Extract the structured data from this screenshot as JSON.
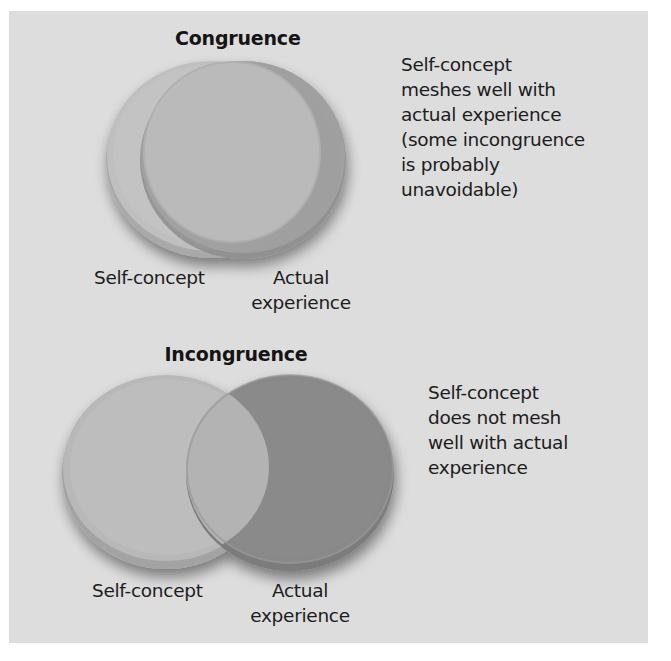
{
  "diagram": {
    "colors": {
      "background": "#dddddd",
      "self_concept_fill": "#bdbdbd",
      "actual_experience_fill": "#8a8a8a",
      "overlap_fill": "#b4b4b4",
      "text": "#1c1c1c"
    },
    "congruence": {
      "title": "Congruence",
      "left_label": "Self-concept",
      "right_label_line1": "Actual",
      "right_label_line2": "experience",
      "description_lines": [
        "Self-concept",
        "meshes well with",
        "actual experience",
        "(some incongruence",
        "is probably",
        "unavoidable)"
      ]
    },
    "incongruence": {
      "title": "Incongruence",
      "left_label": "Self-concept",
      "right_label_line1": "Actual",
      "right_label_line2": "experience",
      "description_lines": [
        "Self-concept",
        "does not mesh",
        "well with actual",
        "experience"
      ]
    }
  }
}
